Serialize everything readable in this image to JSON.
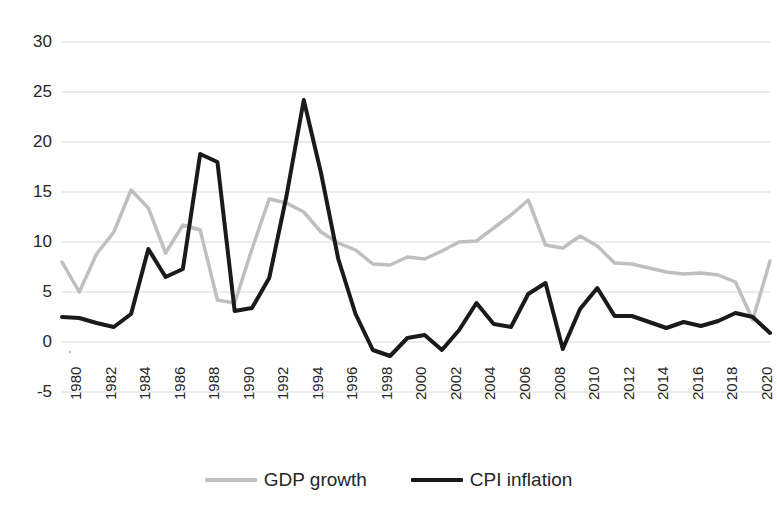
{
  "chart_data": {
    "type": "line",
    "title": "",
    "xlabel": "",
    "ylabel": "",
    "xlim": [
      1980,
      2021
    ],
    "ylim": [
      -5,
      30
    ],
    "ytick_values": [
      30,
      25,
      20,
      15,
      10,
      5,
      0,
      -5
    ],
    "ytick_labels": [
      "30",
      "25",
      "20",
      "15",
      "10",
      "5",
      "0",
      "-5"
    ],
    "xtick_values": [
      1980,
      1982,
      1984,
      1986,
      1988,
      1990,
      1992,
      1994,
      1996,
      1998,
      2000,
      2002,
      2004,
      2006,
      2008,
      2010,
      2012,
      2014,
      2016,
      2018,
      2020
    ],
    "xtick_labels": [
      "1980",
      "1982",
      "1984",
      "1986",
      "1988",
      "1990",
      "1992",
      "1994",
      "1996",
      "1998",
      "2000",
      "2002",
      "2004",
      "2006",
      "2008",
      "2010",
      "2012",
      "2014",
      "2016",
      "2018",
      "2020"
    ],
    "xtick_rotation": 90,
    "grid": true,
    "grid_axis": "y",
    "grid_color": "#d9d9d9",
    "legend_position": "bottom",
    "x": [
      1980,
      1981,
      1982,
      1983,
      1984,
      1985,
      1986,
      1987,
      1988,
      1989,
      1990,
      1991,
      1992,
      1993,
      1994,
      1995,
      1996,
      1997,
      1998,
      1999,
      2000,
      2001,
      2002,
      2003,
      2004,
      2005,
      2006,
      2007,
      2008,
      2009,
      2010,
      2011,
      2012,
      2013,
      2014,
      2015,
      2016,
      2017,
      2018,
      2019,
      2020,
      2021
    ],
    "series": [
      {
        "name": "GDP growth",
        "color": "#bfbfbf",
        "line_width": 3.5,
        "values": [
          8.0,
          5.0,
          8.8,
          11.0,
          15.2,
          13.4,
          8.9,
          11.7,
          11.2,
          4.2,
          3.9,
          9.3,
          14.3,
          13.9,
          13.0,
          11.0,
          9.9,
          9.2,
          7.8,
          7.7,
          8.5,
          8.3,
          9.1,
          10.0,
          10.1,
          11.4,
          12.7,
          14.2,
          9.7,
          9.4,
          10.6,
          9.6,
          7.9,
          7.8,
          7.4,
          7.0,
          6.8,
          6.9,
          6.7,
          6.0,
          2.2,
          8.1
        ]
      },
      {
        "name": "CPI inflation",
        "color": "#1a1a1a",
        "line_width": 4,
        "values": [
          2.5,
          2.4,
          1.9,
          1.5,
          2.8,
          9.3,
          6.5,
          7.3,
          18.8,
          18.0,
          3.1,
          3.4,
          6.4,
          14.6,
          24.2,
          16.9,
          8.3,
          2.8,
          -0.8,
          -1.4,
          0.4,
          0.7,
          -0.8,
          1.2,
          3.9,
          1.8,
          1.5,
          4.8,
          5.9,
          -0.7,
          3.3,
          5.4,
          2.6,
          2.6,
          2.0,
          1.4,
          2.0,
          1.6,
          2.1,
          2.9,
          2.5,
          0.9
        ]
      }
    ]
  },
  "legend": {
    "items": [
      {
        "label": "GDP growth",
        "color": "#bfbfbf"
      },
      {
        "label": "CPI inflation",
        "color": "#1a1a1a"
      }
    ]
  }
}
